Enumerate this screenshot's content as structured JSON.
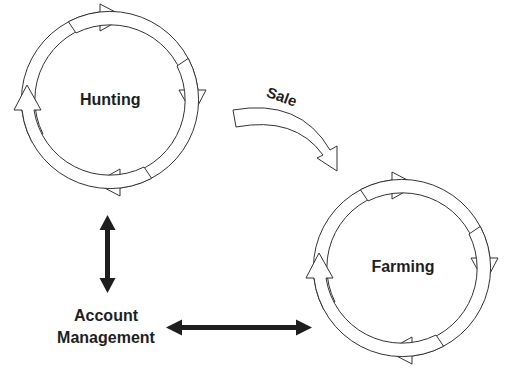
{
  "diagram": {
    "type": "cycle-diagram",
    "colors": {
      "stroke": "#333333",
      "fill": "#ffffff",
      "solid_arrow": "#1e1e1e",
      "text": "#1e1e1e"
    },
    "cycles": [
      {
        "id": "hunting",
        "label": "Hunting",
        "center": [
          110,
          100
        ],
        "radius": 88,
        "arrow_count": 4
      },
      {
        "id": "farming",
        "label": "Farming",
        "center": [
          402,
          268
        ],
        "radius": 88,
        "arrow_count": 4
      }
    ],
    "connectors": [
      {
        "id": "sale",
        "label": "Sale",
        "from": "hunting",
        "to": "farming",
        "style": "hollow-curved",
        "direction": "one-way"
      },
      {
        "id": "hunting-account",
        "from": "hunting",
        "to": "account_management",
        "style": "solid",
        "direction": "two-way"
      },
      {
        "id": "account-farming",
        "from": "account_management",
        "to": "farming",
        "style": "solid",
        "direction": "two-way"
      }
    ],
    "nodes": {
      "account_management": {
        "line1": "Account",
        "line2": "Management"
      }
    },
    "labels": {
      "hunting": "Hunting",
      "farming": "Farming",
      "sale": "Sale",
      "account_line1": "Account",
      "account_line2": "Management"
    }
  }
}
